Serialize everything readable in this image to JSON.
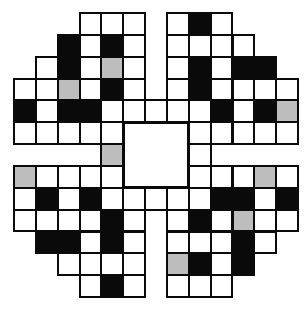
{
  "puzzle": {
    "rows": 13,
    "cols": 13,
    "origin_x": 14,
    "origin_y": 13,
    "cell_size": 21.85,
    "legend": {
      ".": "empty-gap",
      "W": "white-cell",
      "B": "black-cell",
      "G": "gray-cell",
      "C": "center-square"
    },
    "grid": [
      "...WWW.WBW...",
      "..BWBW.WWWW..",
      ".WBWGW.WBWBB.",
      "WWGWBW.WBWWWW",
      "BWBBWWWWWBWBG",
      "WWWWWCCCWWWWW",
      "....GCCCW....",
      "GWWWWCCCWWWGW",
      "WBWBWWWWWBBWB",
      "WWWWBW.WBWGWW",
      ".BBWBW.WWWBW.",
      "..WWWW.GBWB..",
      "...WBW.WWW..."
    ],
    "center_square": {
      "row": 5,
      "col": 5,
      "span": 3
    },
    "colors": {
      "line": "#0a0a0a",
      "black": "#0a0a0a",
      "gray": "#bdbdbd",
      "white": "#ffffff"
    }
  }
}
